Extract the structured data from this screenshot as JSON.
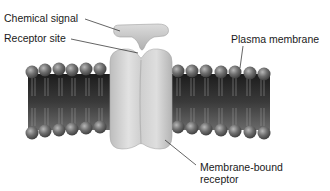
{
  "diagram": {
    "labels": {
      "chemical_signal": "Chemical signal",
      "receptor_site": "Receptor site",
      "plasma_membrane": "Plasma membrane",
      "membrane_bound_receptor_line1": "Membrane-bound",
      "membrane_bound_receptor_line2": "receptor"
    },
    "colors": {
      "membrane_core": "#2e2e2e",
      "phospholipid_head": "#6a6a6a",
      "receptor": "#cfcfcf",
      "signal": "#c8c8c8",
      "leader_line": "#222222",
      "text": "#1a1a1a"
    }
  }
}
